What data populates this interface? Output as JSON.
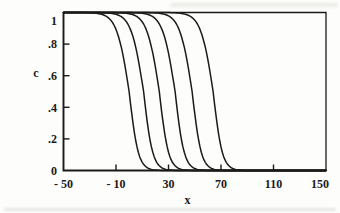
{
  "figure": {
    "background_color": "#fdfdfb",
    "line_color": "#1a1a1a"
  },
  "chart_data": {
    "type": "line",
    "title": "",
    "xlabel": "x",
    "ylabel": "c",
    "grid": false,
    "legend": null,
    "x_axis": {
      "label": "x",
      "range": [
        -50,
        150
      ],
      "tick_values": [
        -50,
        -10,
        30,
        70,
        110,
        150
      ],
      "tick_labels": [
        "- 50",
        "- 10",
        "30",
        "70",
        "110",
        "150"
      ],
      "tick_marks_at": [
        -10,
        30,
        70,
        110
      ]
    },
    "y_axis": {
      "label": "c",
      "range": [
        0,
        1
      ],
      "tick_values": [
        0,
        0.2,
        0.4,
        0.6,
        0.8,
        1
      ],
      "tick_labels": [
        "0",
        ".2",
        ".4",
        ".6",
        ".8",
        "1"
      ],
      "tick_marks_at": [
        0.2,
        0.4,
        0.6,
        0.8
      ]
    },
    "front_profile": {
      "shape": "descending sigmoid front, c=1 behind front, c=0 ahead of front",
      "plateau_high": 1,
      "plateau_low": 0,
      "upper_steepness": 0.212,
      "lower_steepness": 0.29
    },
    "series": [
      {
        "name": "wavefront-1",
        "front_position": 0
      },
      {
        "name": "wavefront-2",
        "front_position": 11
      },
      {
        "name": "wavefront-3",
        "front_position": 23
      },
      {
        "name": "wavefront-4",
        "front_position": 35
      },
      {
        "name": "wavefront-5",
        "front_position": 48
      },
      {
        "name": "wavefront-6",
        "front_position": 64
      }
    ]
  }
}
